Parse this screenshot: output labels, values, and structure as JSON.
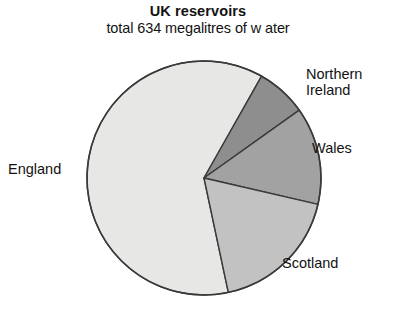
{
  "chart_data": {
    "type": "pie",
    "title": "UK reservoirs",
    "subtitle": "total 634 megalitres of w ater",
    "total_label": "total 634 megalitres of w ater",
    "total_value": 634,
    "units": "megalitres",
    "categories": [
      "England",
      "Northern Ireland",
      "Wales",
      "Scotland"
    ],
    "values": [
      390,
      44,
      85,
      115
    ],
    "percentages": [
      61.5,
      6.9,
      13.5,
      18.1
    ],
    "start_angle_deg": 168,
    "direction": "clockwise",
    "legend": "none",
    "grid": false,
    "slices": [
      {
        "label": "England",
        "value": 390,
        "percent": 61.5,
        "color": "#e7e7e5",
        "start_deg": 168,
        "end_deg": 389.5,
        "label_position": "left"
      },
      {
        "label": "Northern Ireland",
        "label_line1": "Northern",
        "label_line2": "Ireland",
        "value": 44,
        "percent": 6.9,
        "color": "#8e8e8e",
        "start_deg": 29.5,
        "end_deg": 54.5,
        "label_position": "top-right"
      },
      {
        "label": "Wales",
        "value": 85,
        "percent": 13.5,
        "color": "#a2a2a2",
        "start_deg": 54.5,
        "end_deg": 103,
        "label_position": "right"
      },
      {
        "label": "Scotland",
        "value": 115,
        "percent": 18.1,
        "color": "#c2c2c2",
        "start_deg": 103,
        "end_deg": 168,
        "label_position": "bottom-right"
      }
    ],
    "geometry": {
      "center_x": 204,
      "center_y": 178,
      "radius": 117
    },
    "colors": {
      "england": "#e7e7e5",
      "northern_ireland": "#8e8e8e",
      "wales": "#a2a2a2",
      "scotland": "#c2c2c2",
      "outline": "#3a3a3a",
      "background": "#ffffff",
      "text": "#121212"
    }
  }
}
